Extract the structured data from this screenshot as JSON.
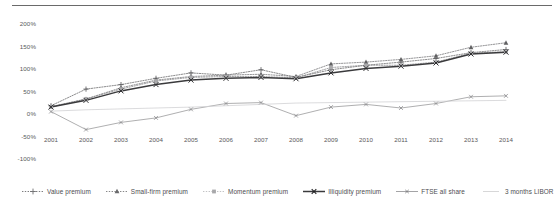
{
  "chart_data": {
    "type": "line",
    "title": "",
    "subtitle": "",
    "xlabel": "",
    "ylabel": "",
    "grid": false,
    "legend_position": "bottom",
    "categories": [
      "2001",
      "2002",
      "2003",
      "2004",
      "2005",
      "2006",
      "2007",
      "2008",
      "2009",
      "2010",
      "2011",
      "2012",
      "2013",
      "2014"
    ],
    "x": [
      2001,
      2002,
      2003,
      2004,
      2005,
      2006,
      2007,
      2008,
      2009,
      2010,
      2011,
      2012,
      2013,
      2014
    ],
    "ylim": [
      -100,
      200
    ],
    "yticks": [
      200,
      150,
      100,
      50,
      0,
      -50,
      -100
    ],
    "ytick_labels": [
      "200%",
      "150%",
      "100%",
      "50%",
      "0%",
      "-50%",
      "-100%"
    ],
    "series": [
      {
        "name": "Value premium",
        "marker": "plus",
        "line_style": "dotted",
        "color": "#6e6e70",
        "values": [
          15,
          52,
          62,
          76,
          88,
          83,
          95,
          78,
          95,
          105,
          112,
          120,
          133,
          140
        ]
      },
      {
        "name": "Small-firm premium",
        "marker": "triangle",
        "line_style": "dotted",
        "color": "#7a7a7c",
        "values": [
          13,
          30,
          55,
          72,
          80,
          83,
          85,
          80,
          108,
          112,
          118,
          126,
          145,
          155
        ]
      },
      {
        "name": "Momentum premium",
        "marker": "square",
        "line_style": "dotted",
        "color": "#8c8c8e",
        "values": [
          12,
          30,
          52,
          70,
          78,
          80,
          80,
          77,
          100,
          105,
          105,
          112,
          132,
          135
        ]
      },
      {
        "name": "Illiquidity premium",
        "marker": "cross",
        "line_style": "solid",
        "color": "#3a3a3c",
        "values": [
          12,
          27,
          48,
          62,
          72,
          76,
          78,
          75,
          88,
          98,
          103,
          110,
          130,
          134
        ]
      },
      {
        "name": "FTSE all share",
        "marker": "cross-small",
        "line_style": "solid",
        "color": "#9a9a9c",
        "values": [
          2,
          -38,
          -22,
          -12,
          7,
          20,
          22,
          -7,
          12,
          18,
          10,
          20,
          35,
          37
        ]
      },
      {
        "name": "3 months LIBOR",
        "marker": "none",
        "line_style": "solid",
        "color": "#d2d2d4",
        "values": [
          3,
          6,
          8,
          10,
          12,
          15,
          18,
          21,
          22,
          23,
          24,
          25,
          26,
          27
        ]
      }
    ]
  },
  "legend": {
    "items": [
      {
        "label": "Value premium"
      },
      {
        "label": "Small-firm premium"
      },
      {
        "label": "Momentum premium"
      },
      {
        "label": "Illiquidity premium"
      },
      {
        "label": "FTSE all share"
      },
      {
        "label": "3 months LIBOR"
      }
    ]
  }
}
